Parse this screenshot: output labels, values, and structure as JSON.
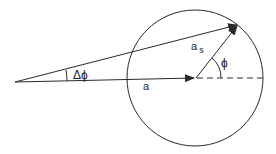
{
  "diagram": {
    "labels": {
      "delta_phi": "Δϕ",
      "a": "a",
      "a_s_main": "a",
      "a_s_sub": "s",
      "phi": "ϕ"
    },
    "elements": {
      "circle": {
        "cx": 195,
        "cy": 78,
        "r": 68
      },
      "origin": {
        "x": 15,
        "y": 82
      },
      "vector_a_end": {
        "x": 195,
        "y": 78
      },
      "vector_sum_end": {
        "x": 238,
        "y": 25
      }
    },
    "stroke_color": "#2a2a2a"
  }
}
